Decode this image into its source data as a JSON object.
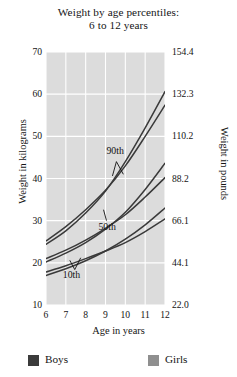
{
  "title": {
    "line1": "Weight by age percentiles:",
    "line2": "6 to 12 years"
  },
  "legend": {
    "boys": {
      "label": "Boys",
      "color": "#3b3b3b"
    },
    "girls": {
      "label": "Girls",
      "color": "#8f8f8f"
    }
  },
  "chart_data": {
    "type": "line",
    "title": "Weight by age percentiles: 6 to 12 years",
    "xlabel": "Age in years",
    "ylabel": "Weight in kilograms",
    "ylabel_secondary": "Weight in pounds",
    "xlim": [
      6,
      12
    ],
    "ylim": [
      10,
      70
    ],
    "grid": true,
    "legend_position": "bottom",
    "plot_background": "#dcdcdc",
    "gridline_color": "#ffffff",
    "line_color": "#3a3a3a",
    "x": [
      6,
      7,
      8,
      9,
      10,
      11,
      12
    ],
    "xticks": [
      "6",
      "7",
      "8",
      "9",
      "10",
      "11",
      "12"
    ],
    "yticks": [
      "10",
      "20",
      "30",
      "40",
      "50",
      "60",
      "70"
    ],
    "yticks_secondary": [
      "22.0",
      "44.1",
      "66.1",
      "88.2",
      "110.2",
      "132.3",
      "154.4"
    ],
    "annotations": [
      {
        "text": "90th",
        "x": 9.6,
        "y": 46.5
      },
      {
        "text": "50th",
        "x": 9.2,
        "y": 28.5
      },
      {
        "text": "10th",
        "x": 7.4,
        "y": 17.0
      }
    ],
    "series": [
      {
        "name": "Boys 90th",
        "percentile": "90th",
        "group": "Boys",
        "values": [
          25.2,
          28.6,
          32.6,
          37.2,
          43.0,
          50.0,
          57.4
        ]
      },
      {
        "name": "Girls 90th",
        "percentile": "90th",
        "group": "Girls",
        "values": [
          24.4,
          27.6,
          31.8,
          37.0,
          44.0,
          52.0,
          60.6
        ]
      },
      {
        "name": "Boys 50th",
        "percentile": "50th",
        "group": "Boys",
        "values": [
          21.0,
          23.0,
          25.4,
          28.2,
          31.4,
          35.6,
          40.2
        ]
      },
      {
        "name": "Girls 50th",
        "percentile": "50th",
        "group": "Girls",
        "values": [
          20.2,
          22.3,
          24.8,
          28.0,
          32.0,
          37.4,
          43.6
        ]
      },
      {
        "name": "Boys 10th",
        "percentile": "10th",
        "group": "Boys",
        "values": [
          17.8,
          19.3,
          21.0,
          22.8,
          24.8,
          27.4,
          30.4
        ]
      },
      {
        "name": "Girls 10th",
        "percentile": "10th",
        "group": "Girls",
        "values": [
          17.0,
          18.6,
          20.5,
          22.8,
          25.6,
          29.0,
          33.0
        ]
      }
    ]
  }
}
